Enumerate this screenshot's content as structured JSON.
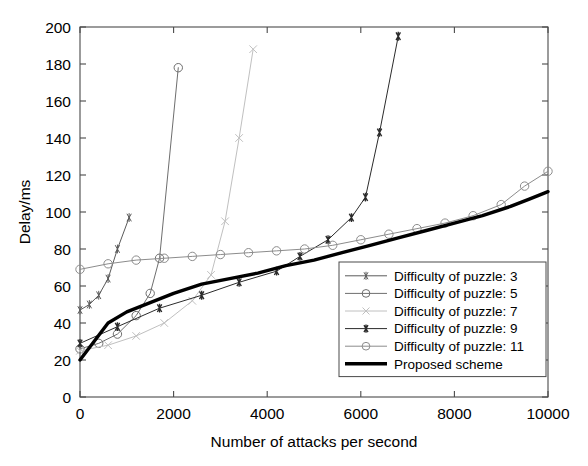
{
  "chart_data": {
    "type": "line",
    "title": "",
    "xlabel": "Number of attacks per second",
    "ylabel": "Delay/ms",
    "xlim": [
      0,
      10000
    ],
    "ylim": [
      0,
      200
    ],
    "xticks": [
      0,
      2000,
      4000,
      6000,
      8000,
      10000
    ],
    "yticks": [
      0,
      20,
      40,
      60,
      80,
      100,
      120,
      140,
      160,
      180,
      200
    ],
    "grid": false,
    "legend_position": "lower right inside axes",
    "series": [
      {
        "name": "Difficulty of puzzle: 3",
        "marker": "asterisk",
        "color": "#5a5a5a",
        "linewidth": 1,
        "x": [
          0,
          200,
          400,
          600,
          800,
          1050
        ],
        "y": [
          47,
          50,
          55,
          64,
          80,
          97
        ]
      },
      {
        "name": "Difficulty of puzzle: 5",
        "marker": "circle",
        "color": "#6e6e6e",
        "linewidth": 1,
        "x": [
          0,
          400,
          800,
          1200,
          1500,
          1700,
          2100
        ],
        "y": [
          26,
          29,
          34,
          44,
          56,
          75,
          178
        ]
      },
      {
        "name": "Difficulty of puzzle: 7",
        "marker": "x",
        "color": "#c0c0c0",
        "linewidth": 1,
        "x": [
          0,
          600,
          1200,
          1800,
          2400,
          2800,
          3100,
          3400,
          3700
        ],
        "y": [
          25,
          28,
          33,
          40,
          52,
          66,
          95,
          140,
          188
        ]
      },
      {
        "name": "Difficulty of puzzle: 9",
        "marker": "asterisk-bold",
        "color": "#2b2b2b",
        "linewidth": 1,
        "x": [
          0,
          800,
          1700,
          2600,
          3400,
          4200,
          4700,
          5300,
          5800,
          6100,
          6400,
          6800
        ],
        "y": [
          29,
          38,
          48,
          55,
          62,
          68,
          76,
          85,
          97,
          108,
          143,
          195
        ]
      },
      {
        "name": "Difficulty of puzzle: 11",
        "marker": "circle",
        "color": "#8c8c8c",
        "linewidth": 1,
        "x": [
          0,
          600,
          1200,
          1800,
          2400,
          3000,
          3600,
          4200,
          4800,
          5400,
          6000,
          6600,
          7200,
          7800,
          8400,
          9000,
          9500,
          10000
        ],
        "y": [
          69,
          72,
          74,
          75,
          76,
          77,
          78,
          79,
          80,
          82,
          85,
          88,
          91,
          94,
          98,
          104,
          114,
          122
        ]
      },
      {
        "name": "Proposed scheme",
        "marker": "none",
        "color": "#000000",
        "linewidth": 3.4,
        "x": [
          0,
          300,
          600,
          1000,
          1500,
          2000,
          2600,
          3200,
          3800,
          4400,
          5000,
          5600,
          6200,
          6800,
          7400,
          8000,
          8600,
          9200,
          9600,
          10000
        ],
        "y": [
          20,
          30,
          40,
          46,
          51,
          56,
          61,
          64,
          67,
          71,
          74,
          78,
          82,
          86,
          90,
          94,
          98,
          103,
          107,
          111
        ]
      }
    ]
  },
  "axes": {
    "ylabel": "Delay/ms",
    "xlabel": "Number of attacks per second",
    "ytick_labels": [
      "0",
      "20",
      "40",
      "60",
      "80",
      "100",
      "120",
      "140",
      "160",
      "180",
      "200"
    ],
    "xtick_labels": [
      "0",
      "2000",
      "4000",
      "6000",
      "8000",
      "10000"
    ]
  },
  "legend": {
    "items": [
      {
        "label": "Difficulty of puzzle: 3",
        "marker": "asterisk",
        "color": "#5a5a5a",
        "linewidth": 1
      },
      {
        "label": "Difficulty of puzzle: 5",
        "marker": "circle",
        "color": "#6e6e6e",
        "linewidth": 1
      },
      {
        "label": "Difficulty of puzzle: 7",
        "marker": "x",
        "color": "#c0c0c0",
        "linewidth": 1
      },
      {
        "label": "Difficulty of puzzle: 9",
        "marker": "asterisk-bold",
        "color": "#2b2b2b",
        "linewidth": 1
      },
      {
        "label": "Difficulty of puzzle: 11",
        "marker": "circle",
        "color": "#8c8c8c",
        "linewidth": 1
      },
      {
        "label": "Proposed scheme",
        "marker": "none",
        "color": "#000000",
        "linewidth": 3.4
      }
    ]
  },
  "colors": {
    "background": "#ffffff",
    "axis": "#4a4a4a",
    "text": "#000000",
    "proposed": "#000000"
  }
}
